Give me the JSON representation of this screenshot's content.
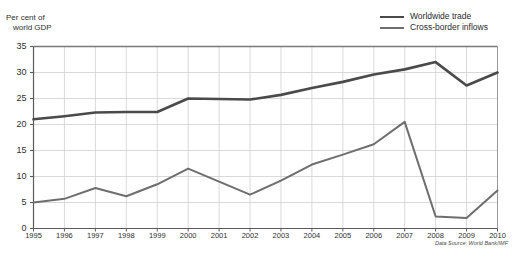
{
  "axis_title": {
    "line1": "Per cent of",
    "line2": "world GDP"
  },
  "legend": {
    "items": [
      {
        "label": "Worldwide trade",
        "color": "#4a4a4a",
        "width": 2.6
      },
      {
        "label": "Cross-border inflows",
        "color": "#6e6e6e",
        "width": 2.0
      }
    ]
  },
  "source_note": "Data Source: World Bank/IMF",
  "title_faint": "",
  "chart_data": {
    "type": "line",
    "title": "",
    "xlabel": "",
    "ylabel": "Per cent of world GDP",
    "x": [
      1995,
      1996,
      1997,
      1998,
      1999,
      2000,
      2001,
      2002,
      2003,
      2004,
      2005,
      2006,
      2007,
      2008,
      2009,
      2010
    ],
    "categories": [
      "1995",
      "1996",
      "1997",
      "1998",
      "1999",
      "2000",
      "2001",
      "2002",
      "2003",
      "2004",
      "2005",
      "2006",
      "2007",
      "2008",
      "2009",
      "2010"
    ],
    "yticks": [
      0,
      5,
      10,
      15,
      20,
      25,
      30,
      35
    ],
    "ylim": [
      0,
      35
    ],
    "xlim": [
      1995,
      2010
    ],
    "grid": true,
    "legend_position": "top-right",
    "series": [
      {
        "name": "Worldwide trade",
        "color": "#4a4a4a",
        "values": [
          21.0,
          21.6,
          22.3,
          22.4,
          22.4,
          25.0,
          24.9,
          24.8,
          25.7,
          27.0,
          28.2,
          29.6,
          30.6,
          32.0,
          27.5,
          30.0
        ]
      },
      {
        "name": "Cross-border inflows",
        "color": "#6e6e6e",
        "values": [
          5.0,
          5.7,
          7.8,
          6.2,
          8.5,
          11.5,
          9.0,
          6.5,
          9.2,
          12.3,
          14.2,
          16.2,
          20.5,
          2.3,
          2.0,
          7.3
        ]
      }
    ],
    "annotations": [
      "Data Source: World Bank/IMF"
    ]
  }
}
